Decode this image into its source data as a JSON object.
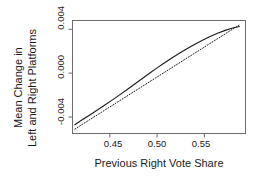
{
  "chart_data": {
    "type": "line",
    "title": "",
    "xlabel": "Previous Right Vote Share",
    "ylabel_line1": "Mean Change in",
    "ylabel_line2": "Left and Right Platforms",
    "xlim": [
      0.4105,
      0.5935
    ],
    "ylim": [
      -0.0055,
      0.0048
    ],
    "xticks": [
      0.45,
      0.5,
      0.55
    ],
    "xticklabels": [
      "0.45",
      "0.50",
      "0.55"
    ],
    "yticks": [
      -0.004,
      0.0,
      0.004
    ],
    "yticklabels": [
      "-0.004",
      "0.000",
      "0.004"
    ],
    "grid": false,
    "legend": "none",
    "series": [
      {
        "name": "fitted-curve",
        "style": "solid",
        "color": "#1a1a1a",
        "x": [
          0.413,
          0.42,
          0.428,
          0.436,
          0.444,
          0.452,
          0.46,
          0.468,
          0.476,
          0.484,
          0.492,
          0.5,
          0.508,
          0.516,
          0.524,
          0.532,
          0.54,
          0.548,
          0.556,
          0.564,
          0.572,
          0.58,
          0.587
        ],
        "y": [
          -0.0047,
          -0.0043,
          -0.00386,
          -0.00341,
          -0.00295,
          -0.00248,
          -0.002,
          -0.00151,
          -0.00101,
          -0.00051,
          -1e-05,
          0.00048,
          0.00095,
          0.0014,
          0.00183,
          0.00224,
          0.00263,
          0.003,
          0.00334,
          0.00364,
          0.0039,
          0.00412,
          0.00425
        ]
      },
      {
        "name": "linear-reference",
        "style": "dotted",
        "color": "#1a1a1a",
        "x": [
          0.413,
          0.587
        ],
        "y": [
          -0.0051,
          0.0044
        ]
      }
    ]
  },
  "axes": {
    "frame_color": "#6b6b6b"
  }
}
